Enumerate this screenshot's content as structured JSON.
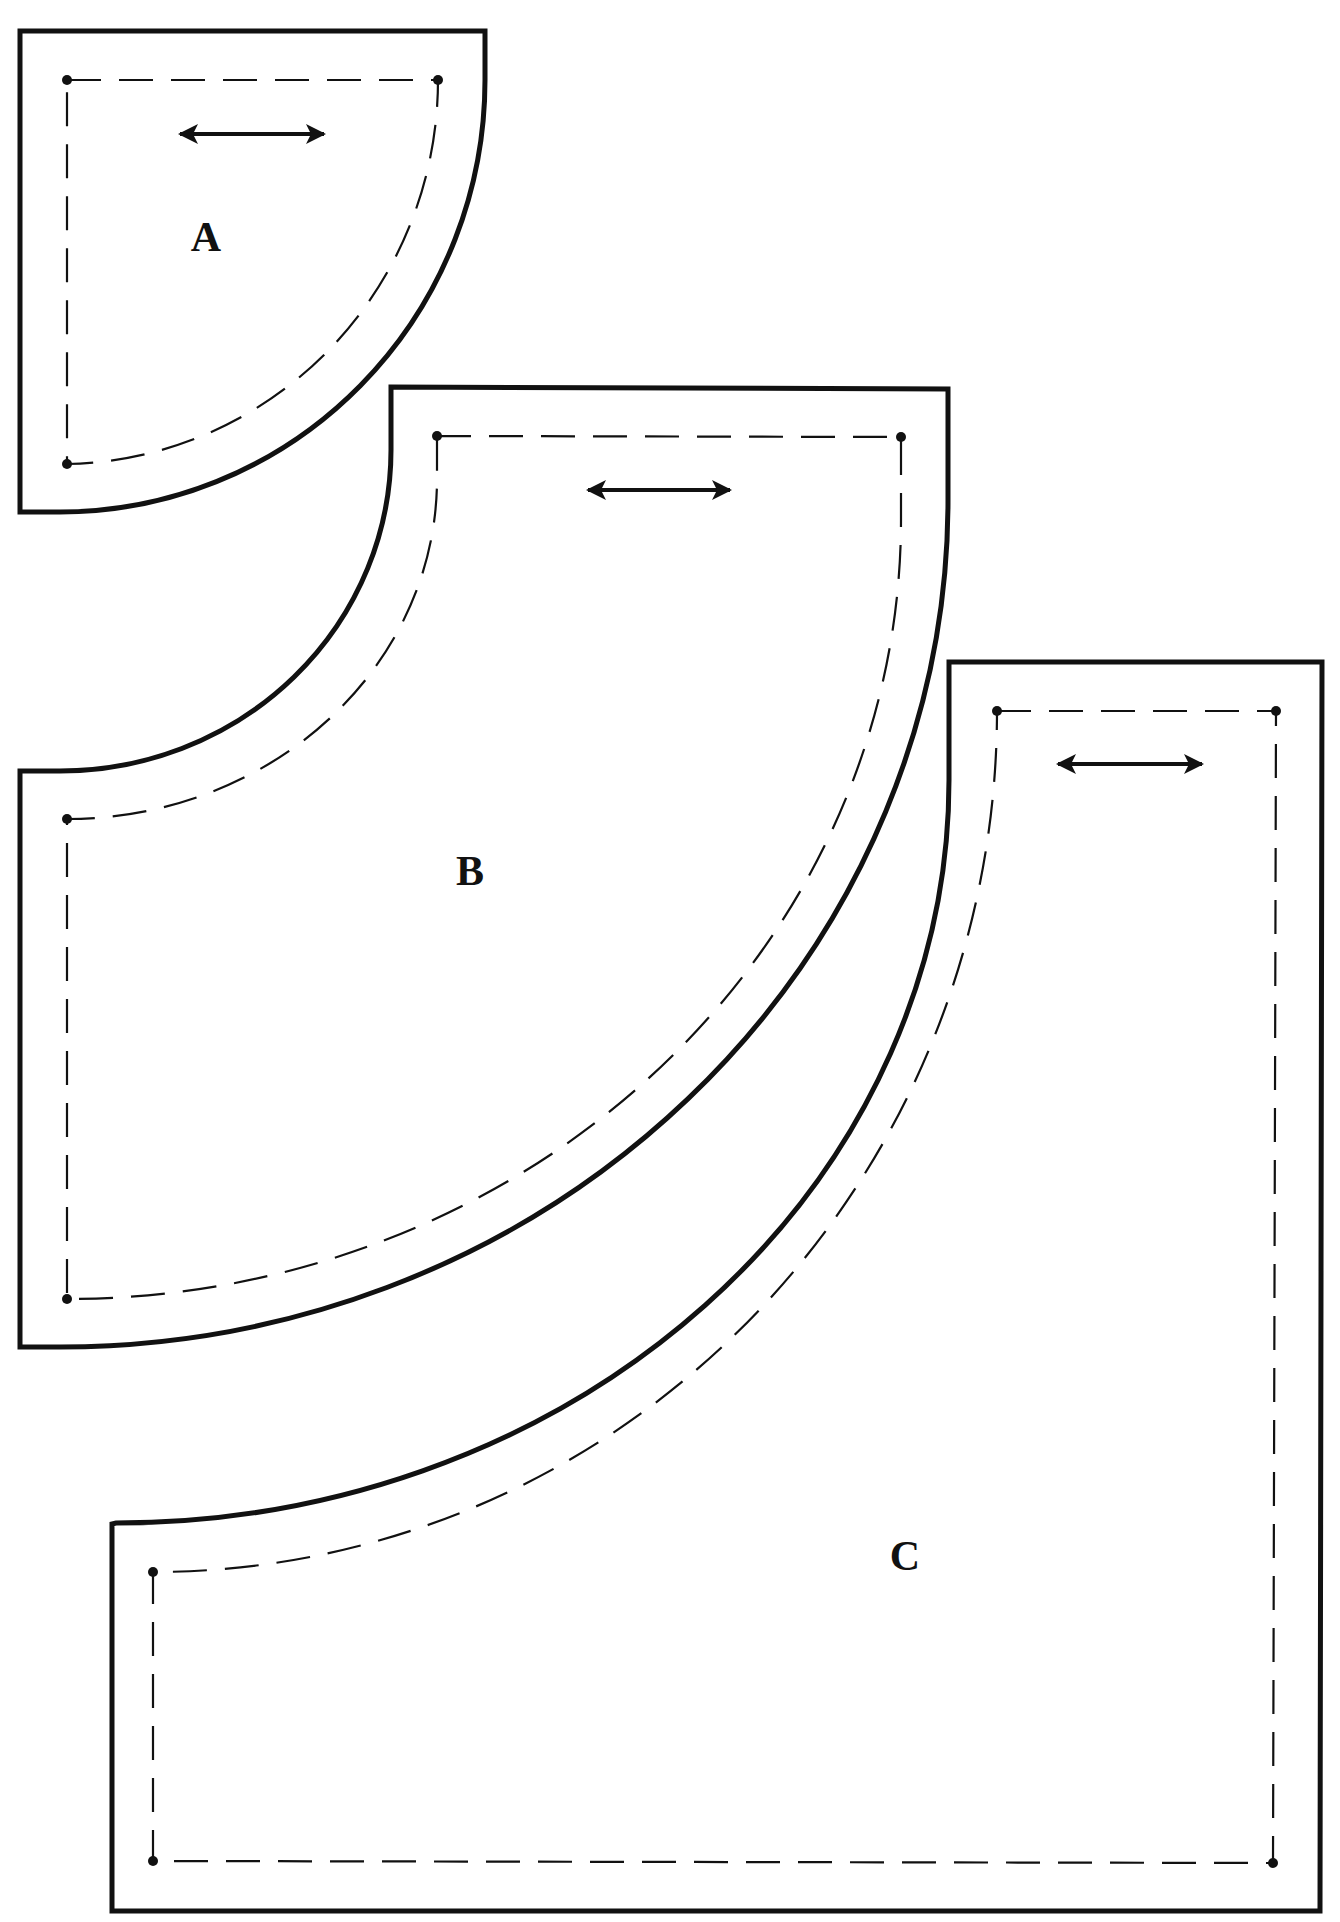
{
  "diagram": {
    "type": "sewing-pattern-pieces",
    "colors": {
      "line": "#111111",
      "background": "#ffffff"
    },
    "legend": {
      "solid_line": "cutting-line",
      "dashed_line": "seam-line",
      "dot": "seam-corner-marker",
      "double_arrow": "grainline"
    },
    "pieces": [
      {
        "id": "A",
        "label": "A",
        "label_pos": [
          206,
          237
        ]
      },
      {
        "id": "B",
        "label": "B",
        "label_pos": [
          470,
          871
        ]
      },
      {
        "id": "C",
        "label": "C",
        "label_pos": [
          905,
          1556
        ]
      }
    ]
  }
}
